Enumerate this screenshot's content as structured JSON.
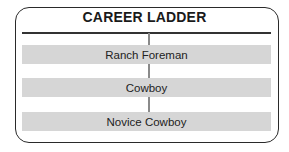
{
  "title": "CAREER LADDER",
  "ladder": {
    "rungs": [
      {
        "label": "Ranch Foreman",
        "top": 45
      },
      {
        "label": "Cowboy",
        "top": 78
      },
      {
        "label": "Novice Cowboy",
        "top": 112
      }
    ]
  },
  "colors": {
    "band": "#d6d6d6",
    "border": "#2a2a2a",
    "connector": "#8a8a8a"
  }
}
